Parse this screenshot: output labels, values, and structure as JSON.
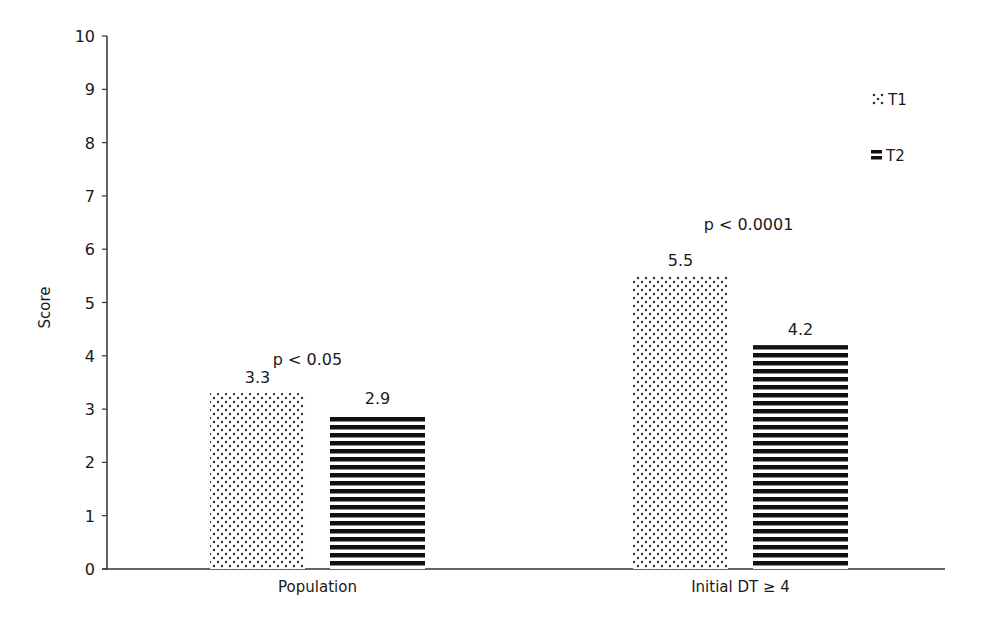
{
  "chart_data": {
    "type": "bar",
    "title": "",
    "xlabel": "",
    "ylabel": "Score",
    "ylim": [
      0,
      10
    ],
    "yticks": [
      0,
      1,
      2,
      3,
      4,
      5,
      6,
      7,
      8,
      9,
      10
    ],
    "grid": false,
    "legend_position": "top-right",
    "categories": [
      "Population",
      "Initial DT ≥ 4"
    ],
    "series": [
      {
        "name": "T1",
        "pattern": "dots",
        "values": [
          3.3,
          5.5
        ]
      },
      {
        "name": "T2",
        "pattern": "horizontal-stripes",
        "values": [
          2.9,
          4.2
        ]
      }
    ],
    "annotations": [
      {
        "category": "Population",
        "text": "p < 0.05"
      },
      {
        "category": "Initial DT ≥ 4",
        "text": "p < 0.0001"
      }
    ],
    "value_labels": [
      [
        "3.3",
        "2.9"
      ],
      [
        "5.5",
        "4.2"
      ]
    ]
  },
  "colors": {
    "ink": "#1a1a1a",
    "background": "#ffffff"
  }
}
